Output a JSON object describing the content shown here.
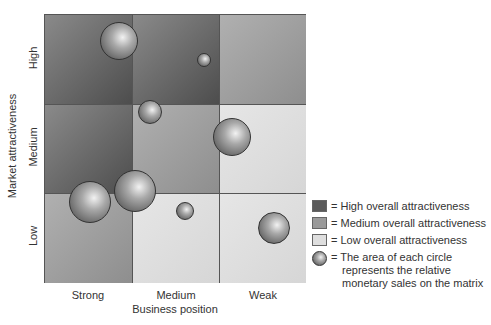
{
  "chart_data": {
    "type": "bubble-matrix",
    "title": "",
    "xlabel": "Business position",
    "ylabel": "Market attractiveness",
    "x_categories": [
      "Strong",
      "Medium",
      "Weak"
    ],
    "y_categories": [
      "High",
      "Medium",
      "Low"
    ],
    "cells": [
      {
        "row": "High",
        "col": "Strong",
        "overall": "high"
      },
      {
        "row": "High",
        "col": "Medium",
        "overall": "high"
      },
      {
        "row": "High",
        "col": "Weak",
        "overall": "medium"
      },
      {
        "row": "Medium",
        "col": "Strong",
        "overall": "high"
      },
      {
        "row": "Medium",
        "col": "Medium",
        "overall": "medium"
      },
      {
        "row": "Medium",
        "col": "Weak",
        "overall": "low"
      },
      {
        "row": "Low",
        "col": "Strong",
        "overall": "medium"
      },
      {
        "row": "Low",
        "col": "Medium",
        "overall": "low"
      },
      {
        "row": "Low",
        "col": "Weak",
        "overall": "low"
      }
    ],
    "bubbles": [
      {
        "cx": 119,
        "cy": 41,
        "r": 19
      },
      {
        "cx": 204,
        "cy": 60,
        "r": 7
      },
      {
        "cx": 150,
        "cy": 112,
        "r": 12
      },
      {
        "cx": 232,
        "cy": 137,
        "r": 19
      },
      {
        "cx": 90,
        "cy": 202,
        "r": 21
      },
      {
        "cx": 135,
        "cy": 191,
        "r": 21
      },
      {
        "cx": 185,
        "cy": 211,
        "r": 9
      },
      {
        "cx": 274,
        "cy": 228,
        "r": 16
      }
    ],
    "legend": [
      {
        "key": "high",
        "label": "High overall attractiveness",
        "color": "#5a5a5a"
      },
      {
        "key": "medium",
        "label": "Medium overall attractiveness",
        "color": "#9a9a9a"
      },
      {
        "key": "low",
        "label": "Low overall attractiveness",
        "color": "#dedede"
      },
      {
        "key": "bubble",
        "label": "The area of each circle represents the relative monetary sales on the matrix"
      }
    ]
  },
  "legend_text": {
    "high": "= High overall attractiveness",
    "medium": "= Medium overall attractiveness",
    "low": "= Low overall attractiveness",
    "bubble_line1": "= The area of each circle",
    "bubble_line2": "represents the relative",
    "bubble_line3": "monetary sales on the matrix"
  }
}
